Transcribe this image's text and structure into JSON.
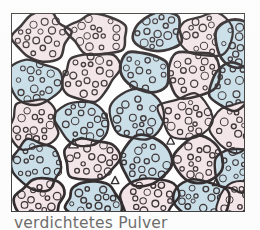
{
  "figure": {
    "caption": "verdichtetes Pulver",
    "frame": {
      "border_color": "#2b2b2b",
      "background_color": "#f3e7ea"
    },
    "page_background": "#fdfdfd"
  },
  "legend": {
    "grain_outline_color": "#1a1416",
    "particle_outline_color": "#241b1e",
    "fill_pink": "#f2e3e7",
    "fill_blue": "#c3dbe6",
    "void_color": "#ffffff",
    "caption_color": "#5d5d5d"
  },
  "chart_data": {
    "type": "diagram",
    "title": "verdichtetes Pulver",
    "grain_count": 42,
    "fill_palette": [
      "#f2e3e7",
      "#c3dbe6"
    ],
    "grains": [
      {
        "id": 1,
        "fill": "pink",
        "cx": 30,
        "cy": 24,
        "rx": 30,
        "ry": 24,
        "rot": -12,
        "particles": 17
      },
      {
        "id": 2,
        "fill": "pink",
        "cx": 88,
        "cy": 20,
        "rx": 31,
        "ry": 21,
        "rot": 8,
        "particles": 15
      },
      {
        "id": 3,
        "fill": "blue",
        "cx": 146,
        "cy": 18,
        "rx": 28,
        "ry": 20,
        "rot": -6,
        "particles": 14
      },
      {
        "id": 4,
        "fill": "pink",
        "cx": 196,
        "cy": 22,
        "rx": 27,
        "ry": 23,
        "rot": 14,
        "particles": 16
      },
      {
        "id": 5,
        "fill": "blue",
        "cx": 228,
        "cy": 30,
        "rx": 22,
        "ry": 26,
        "rot": -9,
        "particles": 12
      },
      {
        "id": 6,
        "fill": "blue",
        "cx": 24,
        "cy": 70,
        "rx": 27,
        "ry": 25,
        "rot": 10,
        "particles": 15
      },
      {
        "id": 7,
        "fill": "pink",
        "cx": 78,
        "cy": 62,
        "rx": 30,
        "ry": 25,
        "rot": -14,
        "particles": 18
      },
      {
        "id": 8,
        "fill": "blue",
        "cx": 133,
        "cy": 58,
        "rx": 26,
        "ry": 22,
        "rot": 6,
        "particles": 13
      },
      {
        "id": 9,
        "fill": "pink",
        "cx": 182,
        "cy": 60,
        "rx": 28,
        "ry": 24,
        "rot": -5,
        "particles": 16
      },
      {
        "id": 10,
        "fill": "blue",
        "cx": 222,
        "cy": 72,
        "rx": 24,
        "ry": 25,
        "rot": 12,
        "particles": 13
      },
      {
        "id": 11,
        "fill": "pink",
        "cx": 22,
        "cy": 112,
        "rx": 26,
        "ry": 24,
        "rot": -8,
        "particles": 15
      },
      {
        "id": 12,
        "fill": "blue",
        "cx": 72,
        "cy": 108,
        "rx": 28,
        "ry": 24,
        "rot": 9,
        "particles": 16
      },
      {
        "id": 13,
        "fill": "blue",
        "cx": 124,
        "cy": 104,
        "rx": 27,
        "ry": 25,
        "rot": -11,
        "particles": 15
      },
      {
        "id": 14,
        "fill": "pink",
        "cx": 176,
        "cy": 106,
        "rx": 29,
        "ry": 24,
        "rot": 7,
        "particles": 17
      },
      {
        "id": 15,
        "fill": "pink",
        "cx": 224,
        "cy": 114,
        "rx": 23,
        "ry": 24,
        "rot": -6,
        "particles": 12
      },
      {
        "id": 16,
        "fill": "blue",
        "cx": 26,
        "cy": 152,
        "rx": 28,
        "ry": 24,
        "rot": 11,
        "particles": 16
      },
      {
        "id": 17,
        "fill": "pink",
        "cx": 80,
        "cy": 148,
        "rx": 29,
        "ry": 23,
        "rot": -7,
        "particles": 16
      },
      {
        "id": 18,
        "fill": "blue",
        "cx": 134,
        "cy": 150,
        "rx": 28,
        "ry": 25,
        "rot": 5,
        "particles": 15
      },
      {
        "id": 19,
        "fill": "pink",
        "cx": 188,
        "cy": 148,
        "rx": 27,
        "ry": 24,
        "rot": -13,
        "particles": 15
      },
      {
        "id": 20,
        "fill": "blue",
        "cx": 226,
        "cy": 156,
        "rx": 22,
        "ry": 24,
        "rot": 8,
        "particles": 12
      },
      {
        "id": 21,
        "fill": "pink",
        "cx": 28,
        "cy": 186,
        "rx": 27,
        "ry": 20,
        "rot": -9,
        "particles": 13
      },
      {
        "id": 22,
        "fill": "blue",
        "cx": 82,
        "cy": 188,
        "rx": 29,
        "ry": 20,
        "rot": 6,
        "particles": 14
      },
      {
        "id": 23,
        "fill": "pink",
        "cx": 138,
        "cy": 186,
        "rx": 28,
        "ry": 21,
        "rot": -5,
        "particles": 14
      },
      {
        "id": 24,
        "fill": "blue",
        "cx": 192,
        "cy": 188,
        "rx": 27,
        "ry": 20,
        "rot": 10,
        "particles": 13
      },
      {
        "id": 25,
        "fill": "pink",
        "cx": 228,
        "cy": 190,
        "rx": 21,
        "ry": 19,
        "rot": -7,
        "particles": 10
      }
    ],
    "voids": [
      {
        "cx": 62,
        "cy": 131,
        "r": 5
      },
      {
        "cx": 104,
        "cy": 168,
        "r": 4
      },
      {
        "cx": 160,
        "cy": 128,
        "r": 4
      },
      {
        "cx": 206,
        "cy": 170,
        "r": 4
      }
    ]
  }
}
